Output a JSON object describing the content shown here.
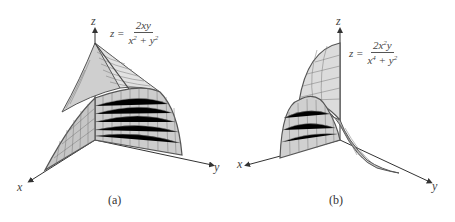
{
  "figure": {
    "panels": [
      {
        "id": "a",
        "caption": "(a)",
        "axes": {
          "x": "x",
          "y": "y",
          "z": "z"
        },
        "formula": {
          "lhs": "z =",
          "numerator": "2xy",
          "denominator_parts": [
            "x",
            "2",
            " + y",
            "2"
          ],
          "text": "z = 2xy / (x^2 + y^2)"
        }
      },
      {
        "id": "b",
        "caption": "(b)",
        "axes": {
          "x": "x",
          "y": "y",
          "z": "z"
        },
        "formula": {
          "lhs": "z =",
          "numerator_parts": [
            "2x",
            "2",
            "y"
          ],
          "denominator_parts": [
            "x",
            "4",
            " + y",
            "2"
          ],
          "text": "z = 2x^2 y / (x^4 + y^2)"
        }
      }
    ],
    "colors": {
      "surface_fill": "#d6d6d6",
      "surface_shade": "#c4c4c4",
      "grid_line": "#6e6e6e",
      "edge_line": "#555555",
      "axis": "#333333",
      "background": "#ffffff"
    }
  }
}
